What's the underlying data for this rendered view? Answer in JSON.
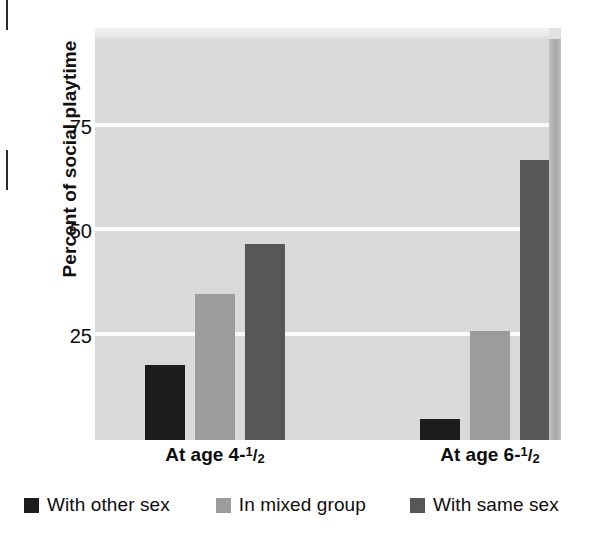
{
  "chart_data": {
    "type": "bar",
    "title": "",
    "xlabel": "",
    "ylabel": "Percent of social playtime",
    "ylim": [
      0,
      96
    ],
    "yticks": [
      25,
      50,
      75
    ],
    "ytick_labels": [
      "25",
      "50",
      "75"
    ],
    "grid": true,
    "legend_position": "bottom",
    "categories": [
      "At age 4-1/2",
      "At age 6-1/2"
    ],
    "category_labels": [
      {
        "prefix": "At age 4-",
        "numerator": "1",
        "slash": "/",
        "denominator": "2"
      },
      {
        "prefix": "At age 6-",
        "numerator": "1",
        "slash": "/",
        "denominator": "2"
      }
    ],
    "series": [
      {
        "name": "With other sex",
        "color": "#1c1c1c",
        "values": [
          18,
          5
        ]
      },
      {
        "name": "In mixed group",
        "color": "#9c9c9c",
        "values": [
          35,
          26
        ]
      },
      {
        "name": "With same sex",
        "color": "#575757",
        "values": [
          47,
          67
        ]
      }
    ]
  },
  "axes": {
    "y_title": "Percent of social playtime",
    "y_ticks": [
      {
        "label": "75",
        "value": 75
      },
      {
        "label": "50",
        "value": 50
      },
      {
        "label": "25",
        "value": 25
      }
    ]
  },
  "legend": {
    "items": [
      {
        "label": "With other sex",
        "color": "#1c1c1c"
      },
      {
        "label": "In mixed group",
        "color": "#9c9c9c"
      },
      {
        "label": "With same sex",
        "color": "#575757"
      }
    ]
  },
  "colors": {
    "plot_background": "#d9d9d9",
    "gridline": "#fbfbfb",
    "page_background": "#ffffff",
    "text": "#0d0d0d",
    "bevel_top": "#e9e9e9",
    "bevel_right": "#a8a8a8"
  }
}
